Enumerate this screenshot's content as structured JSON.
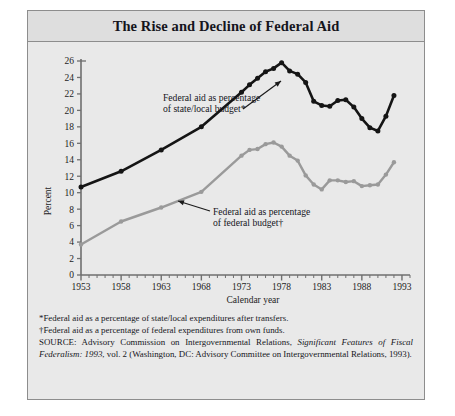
{
  "figure": {
    "number": "FIGURE 6.1",
    "title": "The Rise and Decline of Federal Aid"
  },
  "annotations": {
    "series1_line1": "Federal aid as percentage",
    "series1_line2": "of state/local budget*",
    "series2_line1": "Federal aid as percentage",
    "series2_line2": "of federal budget†"
  },
  "notes": {
    "footnote1": "*Federal aid as a percentage of state/local expenditures after transfers.",
    "footnote2": "†Federal aid as a percentage of federal expenditures from own funds.",
    "source_label": "SOURCE:",
    "source_part1": " Advisory Commission on Intergovernmental Relations, ",
    "source_italic": "Significant Features of Fiscal Federalism: 1993",
    "source_part2": ", vol. 2 (Washington, DC: Advisory Committee on Intergovernmental Relations, 1993)."
  },
  "colors": {
    "series1": "#151515",
    "series2": "#9a9a9a",
    "panel": "#e9e9e9",
    "title_band": "#dedede",
    "frame": "#8d8d8d",
    "axis": "#6f6f6f"
  },
  "chart_data": {
    "type": "line",
    "title": "The Rise and Decline of Federal Aid",
    "xlabel": "Calendar year",
    "ylabel": "Percent",
    "xlim": [
      1953,
      1994
    ],
    "ylim": [
      0,
      26
    ],
    "ytick_step": 2,
    "yticks": [
      0,
      2,
      4,
      6,
      8,
      10,
      12,
      14,
      16,
      18,
      20,
      22,
      24,
      26
    ],
    "xticks_major": [
      1953,
      1958,
      1963,
      1968,
      1973,
      1978,
      1983,
      1988,
      1993
    ],
    "xticks_minor_step": 1,
    "grid": false,
    "legend": "inline-annotations",
    "series": [
      {
        "name": "Federal aid as percentage of state/local budget*",
        "color": "#151515",
        "x": [
          1953,
          1958,
          1963,
          1968,
          1973,
          1974,
          1975,
          1976,
          1977,
          1978,
          1979,
          1980,
          1981,
          1982,
          1983,
          1984,
          1985,
          1986,
          1987,
          1988,
          1989,
          1990,
          1991,
          1992
        ],
        "values": [
          10.7,
          12.6,
          15.2,
          18.0,
          22.2,
          23.1,
          23.9,
          24.7,
          25.1,
          25.8,
          24.8,
          24.4,
          23.4,
          21.1,
          20.6,
          20.5,
          21.2,
          21.3,
          20.4,
          19.0,
          17.9,
          17.5,
          19.3,
          21.8
        ]
      },
      {
        "name": "Federal aid as percentage of federal budget†",
        "color": "#9a9a9a",
        "x": [
          1953,
          1958,
          1963,
          1968,
          1973,
          1974,
          1975,
          1976,
          1977,
          1978,
          1979,
          1980,
          1981,
          1982,
          1983,
          1984,
          1985,
          1986,
          1987,
          1988,
          1989,
          1990,
          1991,
          1992
        ],
        "values": [
          3.7,
          6.5,
          8.2,
          10.1,
          14.5,
          15.2,
          15.3,
          15.9,
          16.1,
          15.6,
          14.5,
          13.9,
          12.1,
          11.0,
          10.4,
          11.5,
          11.5,
          11.3,
          11.4,
          10.8,
          10.9,
          11.0,
          12.2,
          13.7
        ]
      }
    ]
  }
}
